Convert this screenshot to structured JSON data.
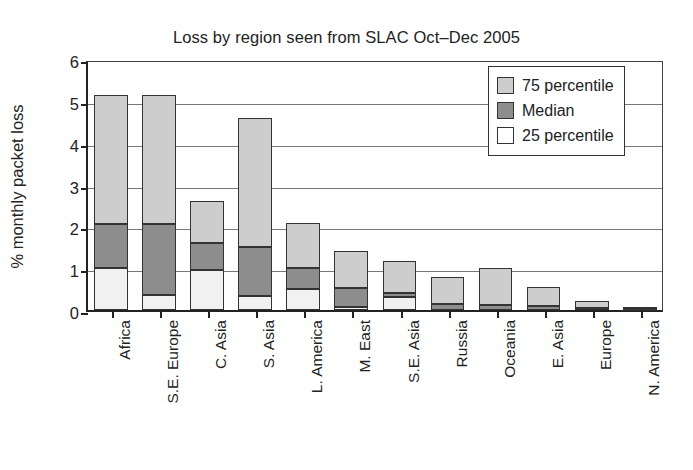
{
  "chart_data": {
    "type": "bar",
    "title": "Loss by region seen from SLAC Oct–Dec 2005",
    "xlabel": "",
    "ylabel": "% monthly packet loss",
    "ylim": [
      0,
      6
    ],
    "yticks": [
      "0",
      "1",
      "2",
      "3",
      "4",
      "5",
      "6"
    ],
    "grid": true,
    "stacked": true,
    "legend_position": "top-right",
    "categories": [
      "Africa",
      "S.E. Europe",
      "C. Asia",
      "S. Asia",
      "L. America",
      "M. East",
      "S.E. Asia",
      "Russia",
      "Oceania",
      "E. Asia",
      "Europe",
      "N. America"
    ],
    "series": [
      {
        "name": "75 percentile",
        "color": "#cdcdcd",
        "values": [
          5.15,
          5.15,
          2.6,
          4.6,
          2.08,
          1.42,
          1.17,
          0.8,
          1.0,
          0.55,
          0.22,
          0.07
        ]
      },
      {
        "name": "Median",
        "color": "#8d8d8d",
        "values": [
          2.05,
          2.05,
          1.6,
          1.5,
          1.0,
          0.52,
          0.4,
          0.15,
          0.12,
          0.1,
          0.05,
          0.03
        ]
      },
      {
        "name": "25 percentile",
        "color": "#f1f1f1",
        "values": [
          1.0,
          0.35,
          0.95,
          0.33,
          0.5,
          0.08,
          0.3,
          0.0,
          0.0,
          0.0,
          0.0,
          0.0
        ]
      }
    ],
    "legend": [
      {
        "label": "75 percentile",
        "swatch": "light-gray"
      },
      {
        "label": "Median",
        "swatch": "dark-gray"
      },
      {
        "label": "25 percentile",
        "swatch": "white"
      }
    ]
  }
}
